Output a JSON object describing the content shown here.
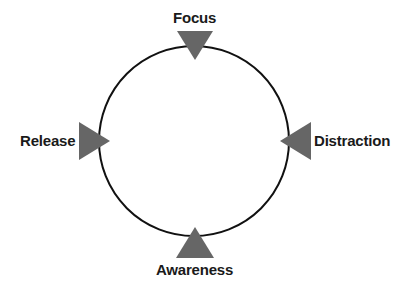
{
  "diagram": {
    "type": "cycle",
    "stages": [
      {
        "id": "top",
        "label": "Focus"
      },
      {
        "id": "right",
        "label": "Distraction"
      },
      {
        "id": "bottom",
        "label": "Awareness"
      },
      {
        "id": "left",
        "label": "Release"
      }
    ],
    "colors": {
      "circle": "#111111",
      "arrow": "#666666",
      "text": "#1a1a1a",
      "background": "#ffffff"
    }
  }
}
